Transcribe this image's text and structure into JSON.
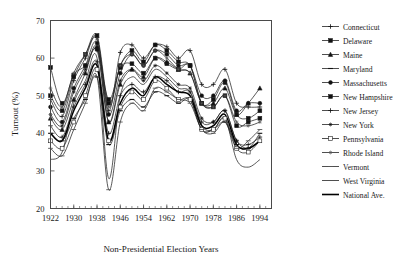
{
  "chart_data": {
    "type": "line",
    "title": "",
    "xlabel": "Non-Presidential Election Years",
    "ylabel": "Turnout (%)",
    "xlim": [
      1922,
      1998
    ],
    "ylim": [
      20,
      70
    ],
    "ytick_labels": [
      "20",
      "30",
      "40",
      "50",
      "60",
      "70"
    ],
    "ytick_values": [
      20,
      30,
      40,
      50,
      60,
      70
    ],
    "xtick_labels": [
      "1922",
      "1930",
      "1938",
      "1946",
      "1954",
      "1962",
      "1970",
      "1978",
      "1986",
      "1994"
    ],
    "xtick_values": [
      1922,
      1930,
      1938,
      1946,
      1954,
      1962,
      1970,
      1978,
      1986,
      1994
    ],
    "x_minor_step": 2,
    "grid": false,
    "legend_position": "right",
    "x": [
      1922,
      1926,
      1930,
      1934,
      1938,
      1942,
      1946,
      1950,
      1954,
      1958,
      1962,
      1966,
      1970,
      1974,
      1978,
      1982,
      1986,
      1990,
      1994
    ],
    "series": [
      {
        "name": "Connecticut",
        "marker": "plus",
        "values": [
          49.0,
          44.5,
          54.0,
          60.0,
          65.5,
          46.0,
          61.5,
          63.5,
          60.0,
          63.5,
          63.0,
          60.0,
          62.0,
          53.0,
          53.0,
          57.0,
          48.0,
          47.0,
          47.0
        ]
      },
      {
        "name": "Delaware",
        "marker": "filled-square",
        "values": [
          57.5,
          48.0,
          55.5,
          58.0,
          62.5,
          49.0,
          57.5,
          58.5,
          56.0,
          60.0,
          58.5,
          57.0,
          58.0,
          48.0,
          49.0,
          53.5,
          45.0,
          44.0,
          46.0
        ]
      },
      {
        "name": "Maine",
        "marker": "filled-tri",
        "values": [
          44.0,
          41.0,
          49.0,
          56.0,
          63.0,
          43.0,
          53.0,
          57.0,
          55.0,
          60.0,
          59.0,
          57.0,
          56.0,
          48.0,
          48.0,
          52.0,
          45.0,
          48.0,
          52.0
        ]
      },
      {
        "name": "Maryland",
        "marker": "dash",
        "values": [
          40.0,
          38.0,
          44.0,
          49.0,
          55.0,
          37.0,
          46.0,
          49.0,
          47.0,
          51.0,
          50.0,
          48.0,
          49.0,
          41.0,
          41.0,
          43.0,
          37.0,
          36.0,
          40.0
        ]
      },
      {
        "name": "Massachusetts",
        "marker": "filled-circle",
        "values": [
          47.0,
          43.0,
          52.0,
          58.0,
          64.0,
          45.0,
          56.0,
          61.0,
          58.0,
          62.0,
          61.0,
          58.0,
          58.0,
          50.0,
          50.0,
          54.0,
          46.0,
          48.0,
          48.0
        ]
      },
      {
        "name": "New Hampshire",
        "marker": "filled-square",
        "values": [
          50.0,
          46.0,
          55.0,
          61.0,
          66.0,
          48.0,
          58.0,
          62.0,
          59.0,
          63.5,
          62.0,
          59.0,
          58.0,
          48.0,
          47.0,
          50.0,
          42.0,
          43.0,
          44.0
        ]
      },
      {
        "name": "New Jersey",
        "marker": "plus",
        "values": [
          42.0,
          39.0,
          47.0,
          53.0,
          59.0,
          40.0,
          50.0,
          53.0,
          51.0,
          55.0,
          54.0,
          51.0,
          51.0,
          43.0,
          43.0,
          46.0,
          38.0,
          37.0,
          39.0
        ]
      },
      {
        "name": "New York",
        "marker": "star",
        "values": [
          45.0,
          42.0,
          51.0,
          57.0,
          62.0,
          43.0,
          54.0,
          57.0,
          54.0,
          58.0,
          56.0,
          53.0,
          52.0,
          44.0,
          43.0,
          46.0,
          38.0,
          36.0,
          38.0
        ]
      },
      {
        "name": "Pennsylvania",
        "marker": "open-square",
        "values": [
          38.0,
          36.0,
          43.0,
          50.0,
          57.0,
          38.0,
          47.0,
          51.0,
          49.0,
          54.0,
          52.0,
          49.0,
          49.0,
          41.0,
          41.0,
          44.0,
          36.0,
          35.0,
          38.0
        ]
      },
      {
        "name": "Rhode Island",
        "marker": "open-star",
        "values": [
          52.0,
          47.0,
          56.0,
          61.0,
          65.0,
          47.0,
          58.0,
          61.0,
          58.0,
          62.0,
          60.0,
          57.0,
          56.0,
          48.0,
          47.0,
          50.0,
          43.0,
          42.0,
          43.0
        ]
      },
      {
        "name": "Vermont",
        "marker": "dash-open",
        "values": [
          36.0,
          34.0,
          41.0,
          48.0,
          55.0,
          25.0,
          43.0,
          48.0,
          46.0,
          52.0,
          51.0,
          49.0,
          48.0,
          41.0,
          40.0,
          43.0,
          36.0,
          38.0,
          41.0
        ]
      },
      {
        "name": "West Virginia",
        "marker": "line-only",
        "values": [
          33.0,
          35.0,
          48.0,
          54.0,
          60.0,
          28.0,
          50.0,
          55.0,
          53.0,
          57.0,
          55.0,
          52.0,
          51.0,
          42.0,
          41.0,
          44.0,
          33.0,
          31.0,
          33.0
        ]
      },
      {
        "name": "National Ave.",
        "marker": "thick-line",
        "values": [
          40.0,
          38.0,
          46.0,
          52.0,
          58.0,
          38.0,
          48.0,
          52.0,
          50.0,
          55.0,
          53.0,
          51.0,
          50.0,
          42.0,
          42.0,
          45.0,
          37.0,
          36.0,
          38.0
        ]
      }
    ]
  },
  "axes": {
    "ylabel": "Turnout (%)",
    "xlabel": "Non-Presidential Election Years"
  },
  "legend": {
    "items": [
      {
        "label": "Connecticut"
      },
      {
        "label": "Delaware"
      },
      {
        "label": "Maine"
      },
      {
        "label": "Maryland"
      },
      {
        "label": "Massachusetts"
      },
      {
        "label": "New Hampshire"
      },
      {
        "label": "New Jersey"
      },
      {
        "label": "New York"
      },
      {
        "label": "Pennsylvania"
      },
      {
        "label": "Rhode Island"
      },
      {
        "label": "Vermont"
      },
      {
        "label": "West Virginia"
      },
      {
        "label": "National Ave."
      }
    ]
  },
  "style": {
    "line_color": "#222222",
    "axis_color": "#4a4a4a",
    "background": "#ffffff"
  }
}
